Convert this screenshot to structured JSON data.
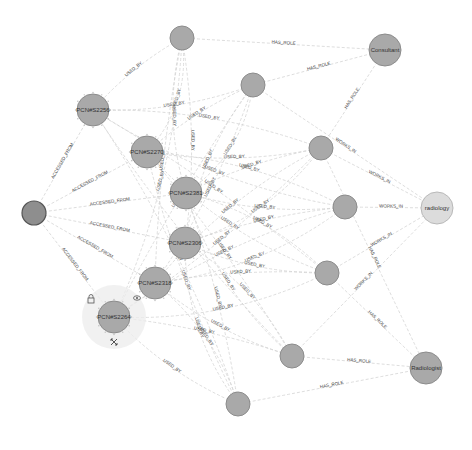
{
  "graph": {
    "nodes": [
      {
        "id": "insight",
        "label": "",
        "x": 34,
        "y": 213,
        "r": 12,
        "kind": "dark"
      },
      {
        "id": "pcn2256",
        "label": "PCN#S2256",
        "x": 93,
        "y": 110,
        "r": 16,
        "kind": "pcn"
      },
      {
        "id": "pcn2270",
        "label": "PCN#S2270",
        "x": 147,
        "y": 152,
        "r": 16,
        "kind": "pcn"
      },
      {
        "id": "pcn2381",
        "label": "PCN#S2381",
        "x": 186,
        "y": 193,
        "r": 16,
        "kind": "pcn"
      },
      {
        "id": "pcn2306",
        "label": "PCN#S2306",
        "x": 185,
        "y": 243,
        "r": 16,
        "kind": "pcn"
      },
      {
        "id": "pcn2318",
        "label": "PCN#S2318",
        "x": 155,
        "y": 283,
        "r": 16,
        "kind": "pcn"
      },
      {
        "id": "pcn2264",
        "label": "PCN#S2264",
        "x": 114,
        "y": 317,
        "r": 16,
        "kind": "pcn",
        "selected": true
      },
      {
        "id": "u1",
        "label": "",
        "x": 182,
        "y": 38,
        "r": 12,
        "kind": "user"
      },
      {
        "id": "u2",
        "label": "",
        "x": 253,
        "y": 85,
        "r": 12,
        "kind": "user"
      },
      {
        "id": "u3",
        "label": "",
        "x": 321,
        "y": 148,
        "r": 12,
        "kind": "user"
      },
      {
        "id": "u4",
        "label": "",
        "x": 345,
        "y": 207,
        "r": 12,
        "kind": "user"
      },
      {
        "id": "u5",
        "label": "",
        "x": 327,
        "y": 273,
        "r": 12,
        "kind": "user"
      },
      {
        "id": "u6",
        "label": "",
        "x": 292,
        "y": 356,
        "r": 12,
        "kind": "user"
      },
      {
        "id": "u7",
        "label": "",
        "x": 238,
        "y": 404,
        "r": 12,
        "kind": "user"
      },
      {
        "id": "consultant",
        "label": "Consultant",
        "x": 385,
        "y": 50,
        "r": 16,
        "kind": "role"
      },
      {
        "id": "radiology",
        "label": "radiology",
        "x": 437,
        "y": 208,
        "r": 16,
        "kind": "dept"
      },
      {
        "id": "radiologist",
        "label": "Radiologist",
        "x": 426,
        "y": 368,
        "r": 16,
        "kind": "role"
      }
    ],
    "edge_types": {
      "accessed_from": "ACCESSED_FROM",
      "used_by": "USED_BY",
      "has_role": "HAS_ROLE",
      "works_in": "WORKS_IN"
    },
    "edges": [
      {
        "from": "insight",
        "to": "pcn2256",
        "label": "ACCESSED_FROM"
      },
      {
        "from": "insight",
        "to": "pcn2270",
        "label": "ACCESSED_FROM"
      },
      {
        "from": "insight",
        "to": "pcn2381",
        "label": "ACCESSED_FROM"
      },
      {
        "from": "insight",
        "to": "pcn2306",
        "label": "ACCESSED_FROM"
      },
      {
        "from": "insight",
        "to": "pcn2318",
        "label": "ACCESSED_FROM"
      },
      {
        "from": "insight",
        "to": "pcn2264",
        "label": "ACCESSED_FROM"
      },
      {
        "from": "u1",
        "to": "consultant",
        "label": "HAS_ROLE"
      },
      {
        "from": "u2",
        "to": "consultant",
        "label": "HAS_ROLE"
      },
      {
        "from": "u3",
        "to": "consultant",
        "label": "HAS_ROLE"
      },
      {
        "from": "u2",
        "to": "radiology",
        "label": "WORKS_IN"
      },
      {
        "from": "u3",
        "to": "radiology",
        "label": "WORKS_IN"
      },
      {
        "from": "u4",
        "to": "radiology",
        "label": "WORKS_IN"
      },
      {
        "from": "u5",
        "to": "radiology",
        "label": "WORKS_IN"
      },
      {
        "from": "u6",
        "to": "radiology",
        "label": "WORKS_IN"
      },
      {
        "from": "u3",
        "to": "radiologist",
        "label": "HAS_ROLE"
      },
      {
        "from": "u5",
        "to": "radiologist",
        "label": "HAS_ROLE"
      },
      {
        "from": "u6",
        "to": "radiologist",
        "label": "HAS_ROLE"
      },
      {
        "from": "u7",
        "to": "radiologist",
        "label": "HAS_ROLE"
      }
    ],
    "used_by_label": "USED_BY"
  },
  "selection_ring": {
    "icons": [
      "lock-icon",
      "eye-icon",
      "expand-icon"
    ]
  },
  "status": {
    "text": ""
  }
}
